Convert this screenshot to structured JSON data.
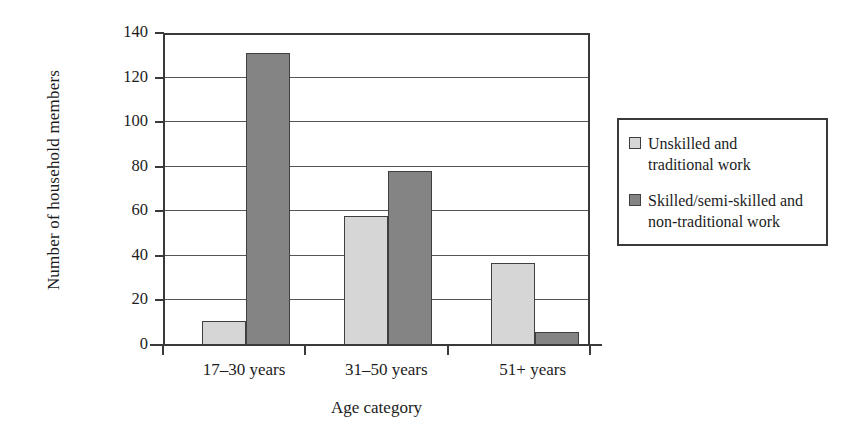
{
  "chart_data": {
    "type": "bar",
    "title": "",
    "xlabel": "Age category",
    "ylabel": "Number of household members",
    "categories": [
      "17–30 years",
      "31–50 years",
      "51+ years"
    ],
    "series": [
      {
        "name": "Unskilled and traditional work",
        "values": [
          11,
          58,
          37
        ],
        "color": "#d6d6d6"
      },
      {
        "name": "Skilled/semi-skilled and non-traditional work",
        "values": [
          131,
          78,
          6
        ],
        "color": "#848484"
      }
    ],
    "ylim": [
      0,
      140
    ],
    "ytick_values": [
      0,
      20,
      40,
      60,
      80,
      100,
      120,
      140
    ],
    "ytick_labels": [
      "0",
      "20",
      "40",
      "60",
      "80",
      "100",
      "120",
      "140"
    ],
    "grid": true,
    "grid_axis": "y",
    "legend_position": "right",
    "legend_entries": [
      {
        "label_line1": "Unskilled and",
        "label_line2": "traditional work",
        "swatch": "light"
      },
      {
        "label_line1": "Skilled/semi-skilled and",
        "label_line2": "non-traditional work",
        "swatch": "dark"
      }
    ]
  }
}
